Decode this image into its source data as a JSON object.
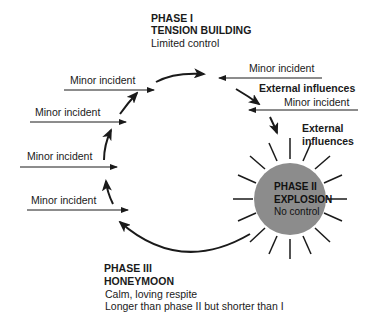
{
  "phase1": {
    "title": "PHASE I",
    "subtitle": "TENSION BUILDING",
    "description": "Limited control"
  },
  "phase2": {
    "title": "PHASE II",
    "subtitle": "EXPLOSION",
    "description": "No control",
    "circle_color": "#8c8c8c"
  },
  "phase3": {
    "title": "PHASE III",
    "subtitle": "HONEYMOON",
    "description_line1": "Calm, loving respite",
    "description_line2": "Longer than phase II but shorter than I"
  },
  "left_inputs": [
    {
      "label": "Minor incident"
    },
    {
      "label": "Minor incident"
    },
    {
      "label": "Minor incident"
    },
    {
      "label": "Minor incident"
    }
  ],
  "right_inputs": {
    "minor_incident_1": "Minor incident",
    "external_influences_1": "External influences",
    "minor_incident_2": "Minor incident",
    "external_influences_2_line1": "External",
    "external_influences_2_line2": "influences"
  },
  "colors": {
    "line": "#1a1a1a",
    "text": "#1a1a1a",
    "background": "#ffffff"
  }
}
